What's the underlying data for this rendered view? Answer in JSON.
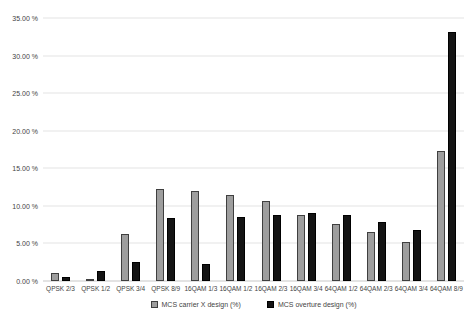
{
  "chart_data": {
    "type": "bar",
    "title": "",
    "xlabel": "",
    "ylabel": "",
    "grid": true,
    "legend_position": "bottom",
    "ylim": [
      0,
      35
    ],
    "yticks": [
      {
        "value": 0,
        "label": "0.00 %"
      },
      {
        "value": 5,
        "label": "5.00 %"
      },
      {
        "value": 10,
        "label": "10.00 %"
      },
      {
        "value": 15,
        "label": "15.00 %"
      },
      {
        "value": 20,
        "label": "20.00 %"
      },
      {
        "value": 25,
        "label": "25.00 %"
      },
      {
        "value": 30,
        "label": "30.00 %"
      },
      {
        "value": 35,
        "label": "35.00 %"
      }
    ],
    "categories": [
      "QPSK 2/3",
      "QPSK 1/2",
      "QPSK 3/4",
      "QPSK 8/9",
      "16QAM 1/3",
      "16QAM 1/2",
      "16QAM 2/3",
      "16QAM 3/4",
      "64QAM 1/2",
      "64QAM 2/3",
      "64QAM 3/4",
      "64QAM 8/9"
    ],
    "series": [
      {
        "name": "MCS carrier X design (%)",
        "fill": "#9e9e9e",
        "border": "#3f3f3f",
        "values": [
          1.1,
          0.1,
          6.2,
          12.2,
          12.0,
          11.5,
          10.6,
          8.8,
          7.6,
          6.5,
          5.2,
          17.3
        ]
      },
      {
        "name": "MCS overture design (%)",
        "fill": "#141414",
        "border": "#000000",
        "values": [
          0.6,
          1.3,
          2.5,
          8.4,
          2.3,
          8.5,
          8.8,
          9.0,
          8.8,
          7.8,
          6.8,
          33.1
        ]
      }
    ]
  },
  "colors": {
    "background": "#ffffff",
    "gridline": "#e4e4e4",
    "axis_text": "#444444"
  }
}
